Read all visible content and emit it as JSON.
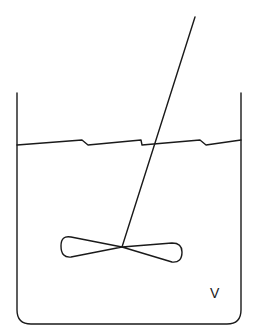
{
  "diagram": {
    "title": "",
    "colors": {
      "stroke": "#1a1a1a",
      "background": "#ffffff"
    },
    "labels": {
      "volume": "V"
    },
    "components": [
      {
        "id": "vessel",
        "label": "vessel"
      },
      {
        "id": "liquid-surface",
        "label": "liquid surface"
      },
      {
        "id": "stirrer-shaft",
        "label": "stirrer shaft"
      },
      {
        "id": "impeller",
        "label": "impeller"
      },
      {
        "id": "volume-label",
        "label": "V"
      }
    ]
  }
}
